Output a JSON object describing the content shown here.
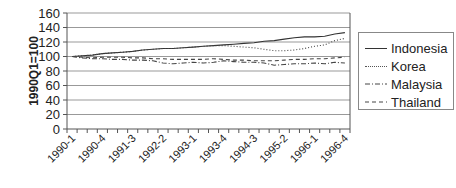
{
  "chart_data": {
    "type": "line",
    "title": "",
    "xlabel": "",
    "ylabel": "1990Q1=100",
    "ylim": [
      0,
      160
    ],
    "yticks": [
      0,
      20,
      40,
      60,
      80,
      100,
      120,
      140,
      160
    ],
    "grid": true,
    "legend_position": "right",
    "x": [
      "1990-1",
      "1990-2",
      "1990-3",
      "1990-4",
      "1991-1",
      "1991-2",
      "1991-3",
      "1991-4",
      "1992-1",
      "1992-2",
      "1992-3",
      "1992-4",
      "1993-1",
      "1993-2",
      "1993-3",
      "1993-4",
      "1994-1",
      "1994-2",
      "1994-3",
      "1994-4",
      "1995-1",
      "1995-2",
      "1995-3",
      "1995-4",
      "1996-1",
      "1996-2",
      "1996-3",
      "1996-4"
    ],
    "xtick_labels": [
      "1990-1",
      "1990-4",
      "1991-3",
      "1992-2",
      "1993-1",
      "1993-4",
      "1994-3",
      "1995-2",
      "1996-1",
      "1996-4"
    ],
    "series": [
      {
        "name": "Indonesia",
        "style": "solid",
        "values": [
          100,
          101,
          102,
          104,
          105,
          106,
          107,
          109,
          110,
          111,
          111,
          112,
          113,
          114,
          115,
          116,
          117,
          118,
          119,
          121,
          122,
          124,
          126,
          127,
          127,
          128,
          131,
          133
        ]
      },
      {
        "name": "Korea",
        "style": "dotted",
        "values": [
          100,
          101,
          102,
          104,
          105,
          106,
          107,
          109,
          110,
          111,
          111,
          112,
          113,
          114,
          115,
          115,
          114,
          113,
          112,
          110,
          108,
          108,
          109,
          111,
          114,
          116,
          122,
          125
        ]
      },
      {
        "name": "Malaysia",
        "style": "dashdot",
        "values": [
          100,
          98,
          97,
          97,
          96,
          96,
          95,
          95,
          94,
          91,
          90,
          91,
          92,
          91,
          92,
          94,
          93,
          92,
          92,
          91,
          88,
          89,
          90,
          90,
          91,
          90,
          92,
          91
        ]
      },
      {
        "name": "Thailand",
        "style": "dashed",
        "values": [
          100,
          99,
          98,
          99,
          99,
          99,
          98,
          98,
          97,
          97,
          96,
          96,
          96,
          96,
          97,
          96,
          95,
          95,
          94,
          94,
          94,
          95,
          96,
          96,
          97,
          97,
          98,
          99
        ]
      }
    ]
  },
  "legend": {
    "items": [
      {
        "label": "Indonesia"
      },
      {
        "label": "Korea"
      },
      {
        "label": "Malaysia"
      },
      {
        "label": "Thailand"
      }
    ]
  }
}
